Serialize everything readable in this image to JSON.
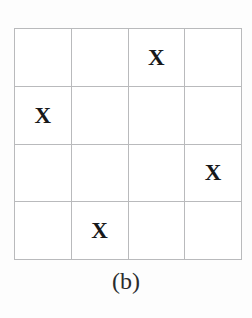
{
  "figure": {
    "caption": "(b)",
    "grid": {
      "rows": 4,
      "columns": 4,
      "mark_symbol": "X",
      "empty_symbol": "",
      "line_color": "#b9babc",
      "frame_color": "#9a9b9d",
      "mark_color": "#17181a",
      "background_color": "#ffffff",
      "cells": [
        [
          {
            "mark": ""
          },
          {
            "mark": ""
          },
          {
            "mark": "X"
          },
          {
            "mark": ""
          }
        ],
        [
          {
            "mark": "X"
          },
          {
            "mark": ""
          },
          {
            "mark": ""
          },
          {
            "mark": ""
          }
        ],
        [
          {
            "mark": ""
          },
          {
            "mark": ""
          },
          {
            "mark": ""
          },
          {
            "mark": "X"
          }
        ],
        [
          {
            "mark": ""
          },
          {
            "mark": "X"
          },
          {
            "mark": ""
          },
          {
            "mark": ""
          }
        ]
      ]
    }
  }
}
